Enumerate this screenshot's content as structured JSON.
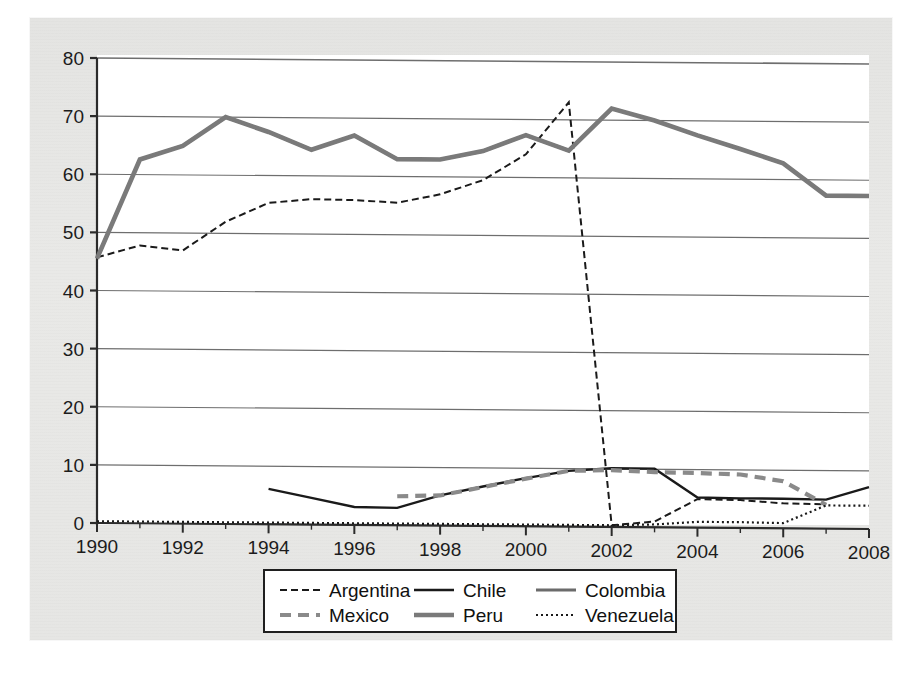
{
  "figure": {
    "background_color": "#e7e7e5",
    "plot_background_color": "#ffffff",
    "axis_color": "#2b2b2b",
    "grid_color": "#6e6e6e"
  },
  "axes": {
    "y_ticks": [
      "0",
      "10",
      "20",
      "30",
      "40",
      "50",
      "60",
      "70",
      "80"
    ],
    "x_ticks": [
      "1990",
      "1992",
      "1994",
      "1996",
      "1998",
      "2000",
      "2002",
      "2004",
      "2006",
      "2008"
    ]
  },
  "legend": {
    "entries": [
      {
        "label": "Argentina",
        "style": "fine-dashed",
        "color": "#1a1a1a",
        "width": 2.0
      },
      {
        "label": "Chile",
        "style": "solid",
        "color": "#1a1a1a",
        "width": 2.4
      },
      {
        "label": "Colombia",
        "style": "solid",
        "color": "#6b6b6b",
        "width": 3.2
      },
      {
        "label": "Mexico",
        "style": "dashed",
        "color": "#8a8a8a",
        "width": 4.2
      },
      {
        "label": "Peru",
        "style": "solid",
        "color": "#7a7a7a",
        "width": 4.6
      },
      {
        "label": "Venezuela",
        "style": "dotted",
        "color": "#1a1a1a",
        "width": 2.2
      }
    ]
  },
  "chart_data": {
    "type": "line",
    "title": "",
    "xlabel": "",
    "ylabel": "",
    "xlim": [
      1990,
      2008
    ],
    "ylim": [
      0,
      80
    ],
    "grid": true,
    "legend_position": "bottom",
    "x": [
      1990,
      1991,
      1992,
      1993,
      1994,
      1995,
      1996,
      1997,
      1998,
      1999,
      2000,
      2001,
      2002,
      2003,
      2004,
      2005,
      2006,
      2007,
      2008
    ],
    "series": [
      {
        "name": "Argentina",
        "color": "#1a1a1a",
        "style": "fine-dashed",
        "width": 2.0,
        "x": [
          1990,
          1991,
          1992,
          1993,
          1994,
          1995,
          1996,
          1997,
          1998,
          1999,
          2000,
          2001,
          2002,
          2003,
          2004,
          2005,
          2006,
          2007
        ],
        "values": [
          45.7,
          47.8,
          47.0,
          52.0,
          55.3,
          56.0,
          55.9,
          55.5,
          57.0,
          59.5,
          64.0,
          73.0,
          0.3,
          1.0,
          4.9,
          4.8,
          4.3,
          4.2
        ]
      },
      {
        "name": "Chile",
        "color": "#1a1a1a",
        "style": "solid",
        "width": 2.4,
        "x": [
          1994,
          1995,
          1996,
          1997,
          1998,
          1999,
          2000,
          2001,
          2002,
          2003,
          2004,
          2005,
          2006,
          2007,
          2008
        ],
        "values": [
          6.1,
          4.6,
          3.1,
          3.0,
          5.2,
          6.8,
          8.3,
          9.6,
          10.1,
          10.1,
          5.2,
          5.1,
          5.1,
          5.0,
          7.2
        ]
      },
      {
        "name": "Colombia",
        "color": "#6b6b6b",
        "style": "solid",
        "width": 3.2,
        "x": [
          1990,
          1991,
          1992,
          1993,
          1994,
          1995,
          1996,
          1997,
          1998,
          1999,
          2000,
          2001,
          2002,
          2003,
          2004,
          2005,
          2006,
          2007,
          2008
        ],
        "values": [
          45.5,
          62.6,
          65.0,
          70.0,
          67.5,
          64.5,
          67.0,
          63.0,
          63.0,
          64.5,
          67.3,
          64.7,
          72.0,
          70.0,
          67.5,
          65.2,
          62.8,
          57.3,
          57.3
        ]
      },
      {
        "name": "Mexico",
        "color": "#8a8a8a",
        "style": "dashed",
        "width": 4.2,
        "x": [
          1997,
          1998,
          1999,
          2000,
          2001,
          2002,
          2003,
          2004,
          2005,
          2006,
          2007
        ],
        "values": [
          5.0,
          5.2,
          6.7,
          8.2,
          9.6,
          9.8,
          9.5,
          9.4,
          9.2,
          8.1,
          4.1
        ]
      },
      {
        "name": "Peru",
        "color": "#7a7a7a",
        "style": "solid",
        "width": 4.6,
        "x": [
          1990,
          1991,
          1992,
          1993,
          1994,
          1995,
          1996,
          1997,
          1998,
          1999,
          2000,
          2001,
          2002,
          2003,
          2004,
          2005,
          2006,
          2007,
          2008
        ],
        "values": [
          45.5,
          62.6,
          65.0,
          70.0,
          67.5,
          64.5,
          67.0,
          63.0,
          63.0,
          64.5,
          67.3,
          64.7,
          72.0,
          70.0,
          67.5,
          65.2,
          62.8,
          57.3,
          57.3
        ]
      },
      {
        "name": "Venezuela",
        "color": "#1a1a1a",
        "style": "dotted",
        "width": 2.2,
        "x": [
          1990,
          1994,
          1996,
          1998,
          2000,
          2001,
          2002,
          2003,
          2004,
          2005,
          2006,
          2007,
          2008
        ],
        "values": [
          0.3,
          0.3,
          0.3,
          0.3,
          0.3,
          0.3,
          0.3,
          0.5,
          1.0,
          1.0,
          0.9,
          4.0,
          4.0
        ]
      }
    ],
    "colombia_peru_overlap": true
  }
}
